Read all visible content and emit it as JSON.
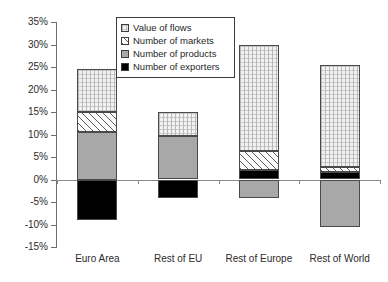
{
  "chart_data": {
    "type": "bar",
    "subtype": "stacked-bar-with-negatives",
    "title": "",
    "subtitle": "",
    "xlabel": "",
    "ylabel": "",
    "ylim": [
      -15,
      35
    ],
    "ytick_step": 5,
    "ytick_labels": [
      "35%",
      "30%",
      "25%",
      "20%",
      "15%",
      "10%",
      "5%",
      "0%",
      "-5%",
      "-10%",
      "-15%"
    ],
    "ytick_values": [
      35,
      30,
      25,
      20,
      15,
      10,
      5,
      0,
      -5,
      -10,
      -15
    ],
    "grid": false,
    "value_unit": "%",
    "legend_position": "top-center-inside",
    "categories": [
      "Euro Area",
      "Rest of EU",
      "Rest of Europe",
      "Rest of World"
    ],
    "series": [
      {
        "name": "Value of flows",
        "key": "flows",
        "fill": "dotted-grid-light",
        "color": "#f2f2f2",
        "values": [
          9.5,
          5.5,
          23.5,
          22.6
        ]
      },
      {
        "name": "Number of markets",
        "key": "markets",
        "fill": "diagonal-hatch",
        "color": "#fbfbfb",
        "values": [
          4.5,
          0.0,
          4.2,
          1.2
        ]
      },
      {
        "name": "Number of products",
        "key": "products",
        "fill": "solid-gray",
        "color": "#a8a8a8",
        "values": [
          10.5,
          9.6,
          -4.2,
          -10.6
        ]
      },
      {
        "name": "Number of exporters",
        "key": "exporters",
        "fill": "solid-black",
        "color": "#000000",
        "values": [
          -9.0,
          -4.2,
          2.2,
          1.6
        ]
      }
    ],
    "stack_totals_positive": [
      24.5,
      15.1,
      29.9,
      25.4
    ],
    "stack_totals_negative": [
      -9.0,
      -4.2,
      -4.2,
      -10.6
    ]
  },
  "axis": {
    "y_labels": [
      {
        "text": "35%",
        "value": 35
      },
      {
        "text": "30%",
        "value": 30
      },
      {
        "text": "25%",
        "value": 25
      },
      {
        "text": "20%",
        "value": 20
      },
      {
        "text": "15%",
        "value": 15
      },
      {
        "text": "10%",
        "value": 10
      },
      {
        "text": "5%",
        "value": 5
      },
      {
        "text": "0%",
        "value": 0
      },
      {
        "text": "-5%",
        "value": -5
      },
      {
        "text": "-10%",
        "value": -10
      },
      {
        "text": "-15%",
        "value": -15
      }
    ],
    "x_labels": [
      "Euro Area",
      "Rest of EU",
      "Rest of Europe",
      "Rest of World"
    ]
  },
  "legend": {
    "items": [
      {
        "label": "Value of flows",
        "swatch": "flows"
      },
      {
        "label": "Number of markets",
        "swatch": "markets"
      },
      {
        "label": "Number of products",
        "swatch": "products"
      },
      {
        "label": "Number of exporters",
        "swatch": "exporters"
      }
    ]
  },
  "colors": {
    "flows": "#f2f2f2",
    "markets": "#fbfbfb",
    "products": "#a8a8a8",
    "exporters": "#000000",
    "axis": "#6d6d6d",
    "zero_line": "#8a8a8a",
    "segment_border": "#4a4a4a",
    "text": "#2b2b2b",
    "background": "#ffffff"
  }
}
